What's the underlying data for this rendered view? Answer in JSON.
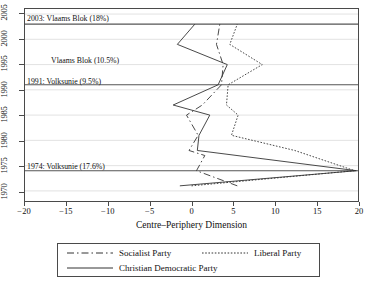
{
  "figure": {
    "background": "#ffffff",
    "frame_color": "#4a4a4a",
    "line_color": "#333333",
    "gridline_color": "#e2e2e2",
    "event_line_color": "#555555"
  },
  "axes": {
    "x": {
      "label": "Centre–Periphery Dimension",
      "ticks": [
        -20,
        -15,
        -10,
        -5,
        0,
        5,
        10,
        15,
        20
      ],
      "tick_labels": [
        "−20",
        "−15",
        "−10",
        "−5",
        "0",
        "5",
        "10",
        "15",
        "20"
      ],
      "min": -20,
      "max": 20
    },
    "y": {
      "label": "",
      "ticks": [
        1970,
        1975,
        1980,
        1985,
        1990,
        1995,
        2000,
        2005
      ],
      "tick_labels": [
        "1970",
        "1975",
        "1980",
        "1985",
        "1990",
        "1995",
        "2000",
        "2005"
      ],
      "min": 1968,
      "max": 2006
    }
  },
  "annotations": [
    {
      "id": "ann-2003",
      "text": "2003: Vlaams Blok (18%)",
      "year": 2003
    },
    {
      "id": "ann-1995",
      "text": "Vlaams Blok (10.5%)",
      "year": 1995
    },
    {
      "id": "ann-1991",
      "text": "1991: Volksunie (9.5%)",
      "year": 1991
    },
    {
      "id": "ann-1974",
      "text": "1974: Volksunie (17.6%)",
      "year": 1974
    }
  ],
  "event_lines": [
    2003,
    1991,
    1974
  ],
  "legend": {
    "items": [
      {
        "name": "Socialist Party",
        "style": "dash-dot"
      },
      {
        "name": "Liberal Party",
        "style": "dotted"
      },
      {
        "name": "Christian Democratic Party",
        "style": "solid"
      }
    ]
  },
  "chart_data": {
    "type": "line",
    "title": "",
    "xlabel": "Centre–Periphery Dimension",
    "ylabel": "",
    "xlim": [
      -20,
      20
    ],
    "ylim": [
      1968,
      2006
    ],
    "grid": true,
    "legend_position": "bottom",
    "orientation": "year-on-y",
    "series": [
      {
        "name": "Socialist Party",
        "style": "dash-dot",
        "points": [
          {
            "year": 1971,
            "value": 5.5
          },
          {
            "year": 1974,
            "value": 0.6
          },
          {
            "year": 1977,
            "value": 1.6
          },
          {
            "year": 1978,
            "value": -0.3
          },
          {
            "year": 1981,
            "value": 0.8
          },
          {
            "year": 1985,
            "value": -0.6
          },
          {
            "year": 1987,
            "value": 1.3
          },
          {
            "year": 1991,
            "value": 3.6
          },
          {
            "year": 1995,
            "value": 3.8
          },
          {
            "year": 1999,
            "value": 3.0
          },
          {
            "year": 2003,
            "value": 3.4
          }
        ]
      },
      {
        "name": "Liberal Party",
        "style": "dotted",
        "points": [
          {
            "year": 1971,
            "value": 0.0
          },
          {
            "year": 1974,
            "value": 19.6
          },
          {
            "year": 1978,
            "value": 12.4
          },
          {
            "year": 1981,
            "value": 4.8
          },
          {
            "year": 1985,
            "value": 5.6
          },
          {
            "year": 1987,
            "value": 4.2
          },
          {
            "year": 1991,
            "value": 4.4
          },
          {
            "year": 1995,
            "value": 8.5
          },
          {
            "year": 1999,
            "value": 4.6
          },
          {
            "year": 2003,
            "value": 5.5
          }
        ]
      },
      {
        "name": "Christian Democratic Party",
        "style": "solid",
        "points": [
          {
            "year": 1971,
            "value": -1.4
          },
          {
            "year": 1974,
            "value": 19.8
          },
          {
            "year": 1978,
            "value": 0.7
          },
          {
            "year": 1981,
            "value": 0.9
          },
          {
            "year": 1985,
            "value": 2.2
          },
          {
            "year": 1987,
            "value": -2.2
          },
          {
            "year": 1991,
            "value": 3.2
          },
          {
            "year": 1995,
            "value": 4.3
          },
          {
            "year": 1999,
            "value": -1.7
          },
          {
            "year": 2003,
            "value": 0.4
          }
        ]
      }
    ]
  }
}
